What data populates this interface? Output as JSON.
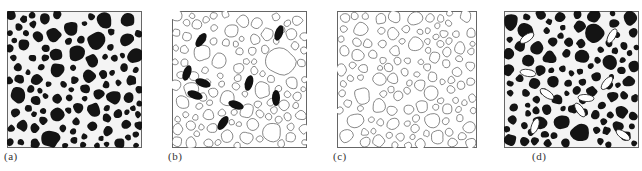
{
  "figure": {
    "panels": [
      {
        "id": "a",
        "label": "(a)",
        "style": "dark-grains-on-white-network",
        "grain_fill": "#111111",
        "network_color": "#ffffff",
        "inclusions": 0
      },
      {
        "id": "b",
        "label": "(b)",
        "style": "outlined-grains-with-dark-elliptical-inclusions",
        "grain_fill": "#ffffff",
        "outline_color": "#555555",
        "inclusion_fill": "#111111",
        "inclusions": 9
      },
      {
        "id": "c",
        "label": "(c)",
        "style": "outlined-grains-only",
        "grain_fill": "#ffffff",
        "outline_color": "#555555",
        "inclusions": 0
      },
      {
        "id": "d",
        "label": "(d)",
        "style": "dark-grains-with-white-elliptical-inclusions",
        "grain_fill": "#111111",
        "network_color": "#ffffff",
        "inclusion_fill": "#ffffff",
        "inclusions": 9
      }
    ]
  }
}
